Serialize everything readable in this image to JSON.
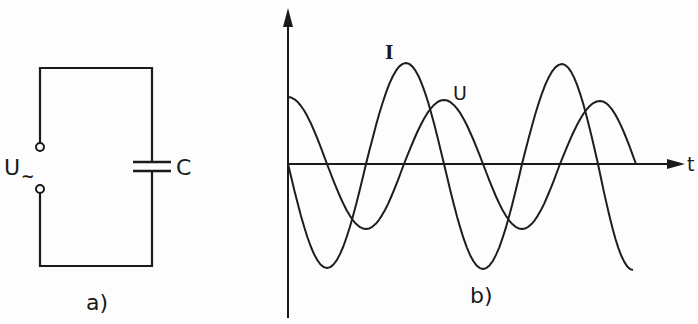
{
  "figure": {
    "panel_a": {
      "caption": "a)",
      "source_label": "U",
      "source_subscript": "~",
      "capacitor_label": "C",
      "components": [
        "ac-voltage-source-terminals",
        "capacitor"
      ]
    },
    "panel_b": {
      "caption": "b)",
      "x_axis_label": "t",
      "curve_labels": {
        "current": "I",
        "voltage": "U"
      }
    }
  },
  "colors": {
    "ink": "#1a1a1a",
    "background": "#fdfdfd"
  },
  "chart_data": {
    "type": "line",
    "title": "",
    "xlabel": "t",
    "ylabel": "",
    "grid": false,
    "axis_origin_px": [
      288,
      164
    ],
    "x_range_px": [
      288,
      684
    ],
    "period_px": 156,
    "series": [
      {
        "name": "I",
        "description": "current, larger amplitude, starts at zero going negative (leads U by a quarter period)",
        "amplitude_px": 104,
        "phase": "-sin(wt)",
        "points_px": [
          [
            288,
            164
          ],
          [
            327,
            268
          ],
          [
            366,
            164
          ],
          [
            406,
            63
          ],
          [
            444,
            164
          ],
          [
            483,
            269
          ],
          [
            522,
            164
          ],
          [
            562,
            64
          ],
          [
            598,
            164
          ],
          [
            633,
            270
          ]
        ]
      },
      {
        "name": "U",
        "description": "voltage, smaller amplitude, starts at maximum",
        "amplitude_px": 66,
        "phase": "cos(wt)",
        "points_px": [
          [
            288,
            97
          ],
          [
            327,
            164
          ],
          [
            366,
            229
          ],
          [
            404,
            164
          ],
          [
            444,
            100
          ],
          [
            483,
            164
          ],
          [
            522,
            229
          ],
          [
            560,
            164
          ],
          [
            600,
            101
          ],
          [
            636,
            164
          ]
        ]
      }
    ],
    "annotations": [
      "I",
      "U",
      "a)",
      "b)",
      "C",
      "U~"
    ]
  }
}
